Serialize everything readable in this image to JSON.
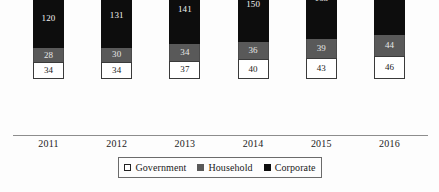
{
  "chart_data": {
    "type": "bar",
    "subtype": "stacked-vertical",
    "title": "",
    "subtitle": "",
    "xlabel": "",
    "ylabel": "",
    "grid": false,
    "axis_visible": {
      "x": true,
      "y": false
    },
    "ylim": [
      0,
      256
    ],
    "categories": [
      "2011",
      "2012",
      "2013",
      "2014",
      "2015",
      "2016"
    ],
    "legend_position": "bottom",
    "series": [
      {
        "name": "Government",
        "color": "#ffffff",
        "values": [
          34,
          34,
          37,
          40,
          43,
          46
        ],
        "stack_order": 1
      },
      {
        "name": "Household",
        "color": "#595959",
        "values": [
          28,
          30,
          34,
          36,
          39,
          44
        ],
        "stack_order": 2
      },
      {
        "name": "Corporate",
        "color": "#0d0d0d",
        "values": [
          120,
          131,
          141,
          150,
          163,
          166
        ],
        "stack_order": 3
      }
    ],
    "totals": [
      182,
      195,
      212,
      226,
      245,
      256
    ]
  },
  "legend": {
    "items": [
      {
        "label": "Government",
        "swatch": "square-outline-white"
      },
      {
        "label": "Household",
        "swatch": "square-gray"
      },
      {
        "label": "Corporate",
        "swatch": "square-black"
      }
    ]
  },
  "colors": {
    "background": "#fdfdfd",
    "axis": "#8d8d8d",
    "corporate": "#0d0d0d",
    "household": "#595959",
    "government": "#ffffff",
    "text": "#1a1a1a"
  }
}
